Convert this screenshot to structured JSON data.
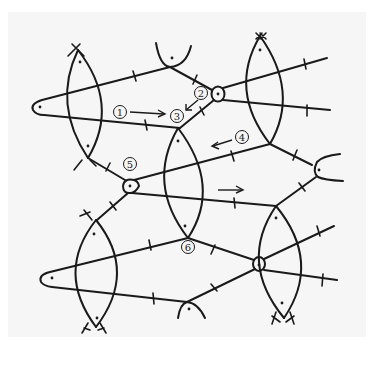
{
  "figure": {
    "colors": {
      "background": "#ffffff",
      "paper": "#f6f6f6",
      "ink": "#1a1a1a"
    },
    "labels": [
      {
        "id": "1",
        "text": "1",
        "x": 120,
        "y": 112
      },
      {
        "id": "2",
        "text": "2",
        "x": 201,
        "y": 93
      },
      {
        "id": "3",
        "text": "3",
        "x": 177,
        "y": 116
      },
      {
        "id": "4",
        "text": "4",
        "x": 242,
        "y": 137
      },
      {
        "id": "5",
        "text": "5",
        "x": 130,
        "y": 164
      },
      {
        "id": "6",
        "text": "6",
        "x": 188,
        "y": 247
      }
    ],
    "arrows": [
      {
        "name": "arrow-1-to-3",
        "from": [
          130,
          112
        ],
        "to": [
          165,
          114
        ]
      },
      {
        "name": "arrow-2-to-3",
        "from": [
          198,
          101
        ],
        "to": [
          187,
          110
        ]
      },
      {
        "name": "arrow-4-left",
        "from": [
          232,
          140
        ],
        "to": [
          212,
          146
        ]
      },
      {
        "name": "arrow-right",
        "from": [
          218,
          190
        ],
        "to": [
          242,
          190
        ]
      }
    ]
  }
}
